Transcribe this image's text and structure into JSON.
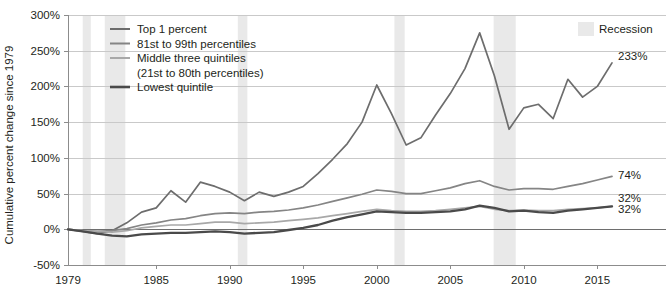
{
  "chart_data": {
    "type": "line",
    "title": "",
    "xlabel": "",
    "ylabel": "Cumulative percent change since 1979",
    "xlim": [
      1979,
      2016
    ],
    "ylim": [
      -50,
      300
    ],
    "ytick_labels": [
      "300%",
      "250%",
      "200%",
      "150%",
      "100%",
      "50%",
      "0%",
      "-50%"
    ],
    "ytick_values": [
      300,
      250,
      200,
      150,
      100,
      50,
      0,
      -50
    ],
    "xtick_labels": [
      "1979",
      "1985",
      "1990",
      "1995",
      "2000",
      "2005",
      "2010",
      "2015"
    ],
    "xtick_values": [
      1979,
      1985,
      1990,
      1995,
      2000,
      2005,
      2010,
      2015
    ],
    "grid": true,
    "legend_position": "top-left",
    "x": [
      1979,
      1980,
      1981,
      1982,
      1983,
      1984,
      1985,
      1986,
      1987,
      1988,
      1989,
      1990,
      1991,
      1992,
      1993,
      1994,
      1995,
      1996,
      1997,
      1998,
      1999,
      2000,
      2001,
      2002,
      2003,
      2004,
      2005,
      2006,
      2007,
      2008,
      2009,
      2010,
      2011,
      2012,
      2013,
      2014,
      2015,
      2016
    ],
    "series": [
      {
        "name": "Top 1 percent",
        "color": "#6d6d6d",
        "end_label": "233%",
        "values": [
          0,
          -3,
          -6,
          -2,
          9,
          24,
          30,
          54,
          38,
          66,
          60,
          52,
          40,
          52,
          46,
          52,
          60,
          78,
          98,
          120,
          150,
          202,
          162,
          118,
          128,
          160,
          190,
          225,
          275,
          215,
          140,
          170,
          175,
          155,
          210,
          185,
          200,
          233
        ]
      },
      {
        "name": "81st to 99th percentiles",
        "color": "#858585",
        "end_label": "74%",
        "values": [
          0,
          -2,
          -3,
          -2,
          1,
          6,
          9,
          13,
          15,
          19,
          22,
          23,
          22,
          24,
          25,
          27,
          30,
          34,
          39,
          44,
          49,
          55,
          53,
          50,
          50,
          54,
          58,
          64,
          68,
          60,
          55,
          57,
          57,
          56,
          60,
          64,
          69,
          74
        ]
      },
      {
        "name": "Middle three quintiles",
        "sublabel": "(21st to 80th percentiles)",
        "color": "#a8a8a8",
        "end_label": "32%",
        "values": [
          0,
          -2,
          -3,
          -4,
          -2,
          2,
          4,
          6,
          6,
          8,
          10,
          10,
          8,
          9,
          10,
          12,
          14,
          16,
          19,
          22,
          25,
          28,
          26,
          25,
          25,
          26,
          28,
          30,
          32,
          28,
          26,
          27,
          26,
          26,
          28,
          29,
          30,
          32
        ]
      },
      {
        "name": "Lowest quintile",
        "color": "#4a4a4a",
        "end_label": "32%",
        "values": [
          0,
          -3,
          -6,
          -9,
          -10,
          -7,
          -6,
          -5,
          -5,
          -4,
          -3,
          -4,
          -6,
          -5,
          -4,
          -1,
          2,
          6,
          12,
          17,
          21,
          25,
          24,
          23,
          23,
          24,
          25,
          28,
          33,
          30,
          25,
          26,
          24,
          23,
          26,
          28,
          30,
          32
        ]
      }
    ],
    "recessions": [
      {
        "start": 1980.0,
        "end": 1980.55
      },
      {
        "start": 1981.5,
        "end": 1982.9
      },
      {
        "start": 1990.55,
        "end": 1991.2
      },
      {
        "start": 2001.2,
        "end": 2001.9
      },
      {
        "start": 2007.95,
        "end": 2009.45
      }
    ],
    "recession_legend_label": "Recession",
    "recession_color": "#e9e9e9"
  }
}
